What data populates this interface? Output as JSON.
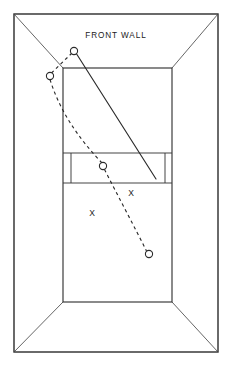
{
  "figure": {
    "background_color": "#ffffff",
    "line_color": "#2b2b2b",
    "width": 232,
    "height": 370
  },
  "labels": {
    "front_wall": "FRONT WALL",
    "front_wall_x": 116,
    "front_wall_y": 36
  },
  "player_marks": [
    {
      "label": "X",
      "x": 131,
      "y": 194,
      "name": "player-mark-1"
    },
    {
      "label": "X",
      "x": 92,
      "y": 214,
      "name": "player-mark-2"
    }
  ],
  "ball_markers": [
    {
      "x": 74,
      "y": 51,
      "r": 3.6,
      "name": "ball-position-1"
    },
    {
      "x": 50,
      "y": 76,
      "r": 3.6,
      "name": "ball-position-2"
    },
    {
      "x": 103,
      "y": 166,
      "r": 3.6,
      "name": "ball-position-3"
    },
    {
      "x": 149,
      "y": 254,
      "r": 3.6,
      "name": "ball-position-4"
    }
  ],
  "geometry": {
    "outer_rect": {
      "x": 14,
      "y": 14,
      "width": 204,
      "height": 338
    },
    "front_wall_rect": {
      "x": 63,
      "y": 68,
      "width": 109,
      "height": 234
    },
    "service_band": {
      "x": 63,
      "y": 153,
      "width": 109,
      "height": 30
    },
    "service_band_left_divider_x": 71,
    "service_band_right_divider_x": 165,
    "perspective_lines": [
      {
        "x1": 14,
        "y1": 14,
        "x2": 63,
        "y2": 68,
        "name": "perspective-line-top-left"
      },
      {
        "x1": 218,
        "y1": 14,
        "x2": 172,
        "y2": 68,
        "name": "perspective-line-top-right"
      },
      {
        "x1": 14,
        "y1": 352,
        "x2": 63,
        "y2": 302,
        "name": "perspective-line-bottom-left"
      },
      {
        "x1": 218,
        "y1": 352,
        "x2": 172,
        "y2": 302,
        "name": "perspective-line-bottom-right"
      }
    ],
    "shot_line": {
      "x1": 76,
      "y1": 53,
      "x2": 156,
      "y2": 179
    },
    "ball_path": "M 72,53 L 51.5,73 M 50,79.5 C 62,118 86,146 102,163 M 104.5,169.5 C 118,196 134,226 146.5,251"
  }
}
